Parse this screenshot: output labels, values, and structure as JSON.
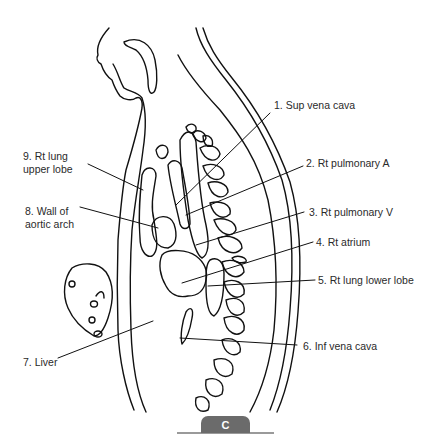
{
  "figure": {
    "panel_label": "C",
    "labels": [
      {
        "id": 1,
        "text": "1. Sup vena cava"
      },
      {
        "id": 2,
        "text": "2. Rt pulmonary A"
      },
      {
        "id": 3,
        "text": "3. Rt pulmonary V"
      },
      {
        "id": 4,
        "text": "4. Rt atrium"
      },
      {
        "id": 5,
        "text": "5. Rt lung lower lobe"
      },
      {
        "id": 6,
        "text": "6. Inf vena cava"
      },
      {
        "id": 7,
        "text": "7. Liver"
      },
      {
        "id": 8,
        "line1": "8. Wall of",
        "line2": "aortic arch"
      },
      {
        "id": 9,
        "line1": "9. Rt lung",
        "line2": "upper lobe"
      }
    ]
  },
  "colors": {
    "line": "#111111",
    "text": "#2a2a2a",
    "tab": "#6b6b6b",
    "rule": "#9a9a9a"
  }
}
